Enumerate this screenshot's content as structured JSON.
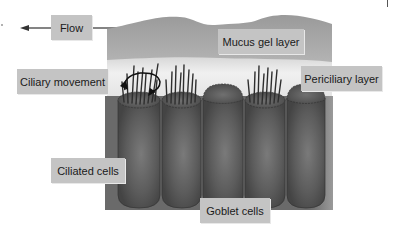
{
  "figure": {
    "labels": {
      "flow": "Flow",
      "mucus": "Mucus gel layer",
      "periciliary": "Periciliary layer",
      "ciliary_movement": "Ciliary movement",
      "ciliated_cells": "Ciliated cells",
      "goblet_cells": "Goblet cells"
    },
    "cells": [
      {
        "type": "ciliated"
      },
      {
        "type": "ciliated"
      },
      {
        "type": "goblet"
      },
      {
        "type": "ciliated"
      },
      {
        "type": "goblet"
      }
    ],
    "colors": {
      "mucus": "#a9a9a9",
      "periciliary": "#e9e9e9",
      "cell_body": "#5e5e5e",
      "background_block": "#6f6f6f",
      "label_bg": "#c4c4c4"
    },
    "flow_direction": "left"
  }
}
